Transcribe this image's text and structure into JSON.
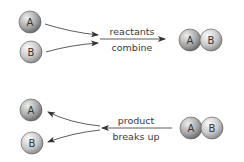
{
  "diagram": {
    "colors": {
      "line": "#333333",
      "text": "#3a3a3a",
      "atom_A_light": "#e0e0e0",
      "atom_A_dark": "#7a7a7a",
      "atom_B_light": "#f2f2f2",
      "atom_B_dark": "#9a9a9a"
    },
    "top": {
      "reactant_a": "A",
      "reactant_b": "B",
      "label_above": "reactants",
      "label_below": "combine",
      "product_a": "A",
      "product_b": "B"
    },
    "bottom": {
      "product_a": "A",
      "product_b": "B",
      "label_above": "product",
      "label_below": "breaks up",
      "result_a": "A",
      "result_b": "B"
    }
  }
}
